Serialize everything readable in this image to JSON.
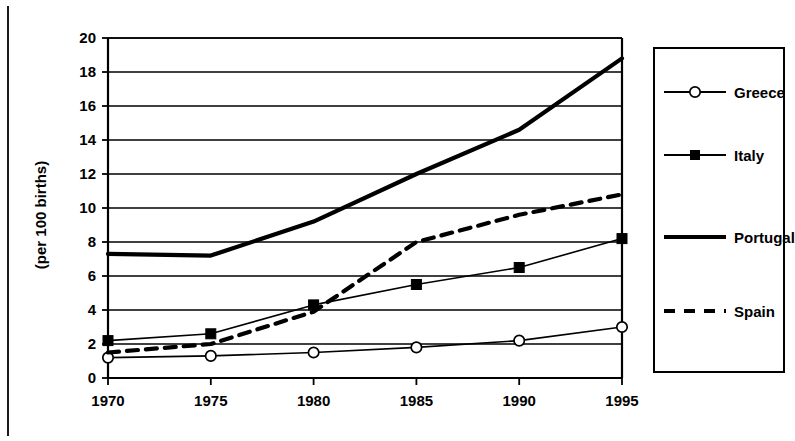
{
  "colors": {
    "ink": "#000000",
    "grid": "#000000",
    "background": "#ffffff"
  },
  "axis": {
    "y_label": "(per 100 births)",
    "y_ticks": [
      "0",
      "2",
      "4",
      "6",
      "8",
      "10",
      "12",
      "14",
      "16",
      "18",
      "20"
    ],
    "x_ticks": [
      "1970",
      "1975",
      "1980",
      "1985",
      "1990",
      "1995"
    ]
  },
  "legend": {
    "items": [
      {
        "label": "Greece",
        "marker": "open-circle",
        "line": "thin-solid"
      },
      {
        "label": "Italy",
        "marker": "filled-square",
        "line": "thin-solid"
      },
      {
        "label": "Portugal",
        "marker": "none",
        "line": "thick-solid"
      },
      {
        "label": "Spain",
        "marker": "none",
        "line": "dashed"
      }
    ]
  },
  "chart_data": {
    "type": "line",
    "title": "",
    "xlabel": "",
    "ylabel": "(per 100 births)",
    "x": [
      1970,
      1975,
      1980,
      1985,
      1990,
      1995
    ],
    "xlim": [
      1970,
      1995
    ],
    "ylim": [
      0,
      20
    ],
    "ytick_step": 2,
    "grid": true,
    "legend_position": "right",
    "series": [
      {
        "name": "Greece",
        "values": [
          1.2,
          1.3,
          1.5,
          1.8,
          2.2,
          3.0
        ],
        "style": "thin-solid",
        "marker": "open-circle"
      },
      {
        "name": "Italy",
        "values": [
          2.2,
          2.6,
          4.3,
          5.5,
          6.5,
          8.2
        ],
        "style": "thin-solid",
        "marker": "filled-square"
      },
      {
        "name": "Portugal",
        "values": [
          7.3,
          7.2,
          9.2,
          12.0,
          14.6,
          18.8
        ],
        "style": "thick-solid",
        "marker": "none"
      },
      {
        "name": "Spain",
        "values": [
          1.5,
          2.0,
          3.9,
          8.0,
          9.6,
          10.8
        ],
        "style": "dashed",
        "marker": "none"
      }
    ]
  }
}
